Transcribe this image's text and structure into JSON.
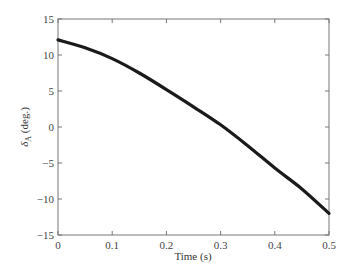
{
  "chart_data": {
    "type": "line",
    "title": "",
    "xlabel": "Time (s)",
    "ylabel": "δ_A (deg.)",
    "ylabel_main": "δ",
    "ylabel_sub": "A",
    "ylabel_rest": " (deg.)",
    "xlim": [
      0,
      0.5
    ],
    "ylim": [
      -15,
      15
    ],
    "xticks": [
      0,
      0.1,
      0.2,
      0.3,
      0.4,
      0.5
    ],
    "xtick_labels": [
      "0",
      "0.1",
      "0.2",
      "0.3",
      "0.4",
      "0.5"
    ],
    "yticks": [
      15,
      10,
      5,
      0,
      -5,
      -10,
      -15
    ],
    "ytick_labels": [
      "15",
      "10",
      "5",
      "0",
      "−5",
      "−10",
      "−15"
    ],
    "grid": false,
    "legend": null,
    "series": [
      {
        "name": "δ_A",
        "color": "#1a1a1a",
        "x": [
          0,
          0.05,
          0.1,
          0.15,
          0.2,
          0.25,
          0.3,
          0.35,
          0.4,
          0.45,
          0.5
        ],
        "values": [
          12.1,
          11.0,
          9.5,
          7.5,
          5.2,
          2.8,
          0.3,
          -2.6,
          -5.7,
          -8.6,
          -12.0
        ]
      }
    ]
  }
}
